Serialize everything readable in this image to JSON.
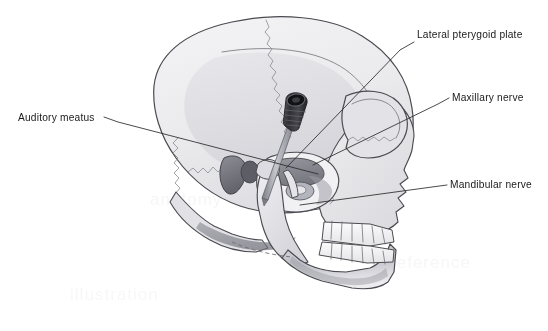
{
  "figure": {
    "type": "anatomical-illustration",
    "view": "lateral (left side) skull radiographic-style line drawing",
    "background_color": "#ffffff",
    "line_color": "#4a4a50",
    "suture_color": "#8a8a92",
    "bone_fill_light": "#efeff1",
    "bone_fill_mid": "#dcdce0",
    "bone_fill_dark": "#b9b9c0",
    "shadow_fill": "#8e8e96",
    "needle_hub_color": "#3a3a3e",
    "needle_shaft_color": "#9a9aa2"
  },
  "labels": [
    {
      "id": "auditory-meatus",
      "text": "Auditory meatus",
      "text_x": 18,
      "text_y": 121,
      "anchor": "start",
      "leader": "M 104 117 L 118 122 L 318 174",
      "target_structure": "external acoustic meatus"
    },
    {
      "id": "lateral-pterygoid-plate",
      "text": "Lateral pterygoid plate",
      "text_x": 417,
      "text_y": 38,
      "anchor": "start",
      "leader": "M 414 42 L 400 50 L 286 168",
      "target_structure": "lateral pterygoid plate"
    },
    {
      "id": "maxillary-nerve",
      "text": "Maxillary nerve",
      "text_x": 452,
      "text_y": 101,
      "anchor": "start",
      "leader": "M 449 98 L 438 104 L 313 165",
      "target_structure": "maxillary division of trigeminal nerve"
    },
    {
      "id": "mandibular-nerve",
      "text": "Mandibular nerve",
      "text_x": 450,
      "text_y": 188,
      "anchor": "start",
      "leader": "M 447 185 L 432 187 L 300 205",
      "target_structure": "mandibular division of trigeminal nerve"
    }
  ],
  "instrument": {
    "name": "needle-and-hub",
    "hub_label": "ribbed needle hub",
    "shaft_label": "needle shaft",
    "hub_x": 294,
    "hub_y": 110,
    "tip_x": 263,
    "tip_y": 196
  },
  "watermark": {
    "visible": true,
    "note": "faint bleed-through ghost text in background",
    "lines": [
      {
        "text": "anatomy",
        "x": 150,
        "y": 205,
        "opacity": 0.5
      },
      {
        "text": "reference",
        "x": 390,
        "y": 268,
        "opacity": 0.45
      },
      {
        "text": "illustration",
        "x": 70,
        "y": 300,
        "opacity": 0.4
      }
    ]
  }
}
